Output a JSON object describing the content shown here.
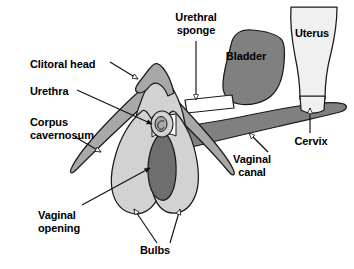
{
  "figure": {
    "type": "anatomical-diagram",
    "background_color": "#ffffff",
    "outline_color": "#1a1a1a",
    "text_color": "#000000"
  },
  "palette": {
    "light_gray": "#d2d2d2",
    "mid_gray": "#a8a8a8",
    "dark_gray": "#808080",
    "darker_gray": "#6e6e6e",
    "near_white": "#f0f0f0",
    "white": "#ffffff"
  },
  "labels": {
    "clitoral_head": {
      "text": "Clitoral head",
      "lines": [
        "Clitoral head"
      ],
      "x": 30,
      "y": 58,
      "align": "left"
    },
    "urethra": {
      "text": "Urethra",
      "lines": [
        "Urethra"
      ],
      "x": 30,
      "y": 85,
      "align": "left"
    },
    "corpus_cavernosum": {
      "text": "Corpus cavernosum",
      "lines": [
        "Corpus",
        "cavernosum"
      ],
      "x": 30,
      "y": 116,
      "align": "left"
    },
    "vaginal_opening": {
      "text": "Vaginal opening",
      "lines": [
        "Vaginal",
        "opening"
      ],
      "x": 38,
      "y": 209,
      "align": "left"
    },
    "bulbs": {
      "text": "Bulbs",
      "lines": [
        "Bulbs"
      ],
      "x": 155,
      "y": 248,
      "align": "center"
    },
    "urethral_sponge": {
      "text": "Urethral sponge",
      "lines": [
        "Urethral",
        "sponge"
      ],
      "x": 196,
      "y": 14,
      "align": "center"
    },
    "bladder": {
      "text": "Bladder",
      "lines": [
        "Bladder"
      ],
      "x": 245,
      "y": 55,
      "align": "center"
    },
    "uterus": {
      "text": "Uterus",
      "lines": [
        "Uterus"
      ],
      "x": 311,
      "y": 33,
      "align": "center"
    },
    "cervix": {
      "text": "Cervix",
      "lines": [
        "Cervix"
      ],
      "x": 310,
      "y": 140,
      "align": "center"
    },
    "vaginal_canal": {
      "text": "Vaginal canal",
      "lines": [
        "Vaginal",
        "canal"
      ],
      "x": 251,
      "y": 158,
      "align": "center"
    }
  },
  "structures": [
    {
      "name": "clitoral-glans",
      "label": "Clitoral head",
      "fill": "mid_gray"
    },
    {
      "name": "clitoral-body",
      "label": "Clitoral body",
      "fill": "light_gray"
    },
    {
      "name": "urethral-opening",
      "label": "Urethra",
      "fill": "mid_gray"
    },
    {
      "name": "crus-left",
      "label": "Corpus cavernosum",
      "fill": "mid_gray"
    },
    {
      "name": "crus-right",
      "label": "Corpus cavernosum",
      "fill": "mid_gray"
    },
    {
      "name": "bulb-left",
      "label": "Bulb",
      "fill": "light_gray"
    },
    {
      "name": "bulb-right",
      "label": "Bulb",
      "fill": "light_gray"
    },
    {
      "name": "vaginal-opening",
      "label": "Vaginal opening",
      "fill": "dark_gray"
    },
    {
      "name": "urethral-sponge",
      "label": "Urethral sponge",
      "fill": "white"
    },
    {
      "name": "bladder",
      "label": "Bladder",
      "fill": "dark_gray"
    },
    {
      "name": "uterus",
      "label": "Uterus",
      "fill": "near_white"
    },
    {
      "name": "cervix",
      "label": "Cervix",
      "fill": "near_white"
    },
    {
      "name": "vaginal-canal",
      "label": "Vaginal canal",
      "fill": "dark_gray"
    }
  ],
  "leaders": [
    {
      "name": "clitoral-head-leader",
      "from_label": "Clitoral head",
      "to_structure": "clitoral-glans",
      "arrow": "open"
    },
    {
      "name": "urethra-leader",
      "from_label": "Urethra",
      "to_structure": "urethral-opening",
      "arrow": "solid"
    },
    {
      "name": "corpus-cavernosum-leader",
      "from_label": "Corpus cavernosum",
      "to_structure": "crus-left",
      "arrow": "open"
    },
    {
      "name": "vaginal-opening-leader",
      "from_label": "Vaginal opening",
      "to_structure": "vaginal-opening",
      "arrow": "solid"
    },
    {
      "name": "bulbs-leader-left",
      "from_label": "Bulbs",
      "to_structure": "bulb-left",
      "arrow": "open"
    },
    {
      "name": "bulbs-leader-right",
      "from_label": "Bulbs",
      "to_structure": "bulb-right",
      "arrow": "open"
    },
    {
      "name": "urethral-sponge-leader",
      "from_label": "Urethral sponge",
      "to_structure": "urethral-sponge",
      "arrow": "open"
    },
    {
      "name": "cervix-leader",
      "from_label": "Cervix",
      "to_structure": "cervix",
      "arrow": "open"
    },
    {
      "name": "vaginal-canal-leader",
      "from_label": "Vaginal canal",
      "to_structure": "vaginal-canal",
      "arrow": "open"
    }
  ]
}
